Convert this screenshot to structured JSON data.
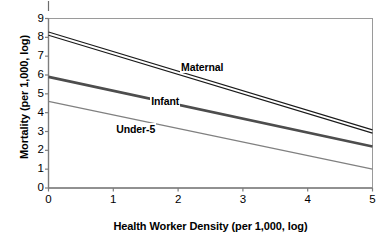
{
  "chart_data": {
    "type": "line",
    "title": "",
    "xlabel": "Health Worker Density (per 1,000, log)",
    "ylabel": "Mortality (per 1,000, log)",
    "xlim": [
      0,
      5
    ],
    "ylim": [
      0,
      9
    ],
    "xticks": [
      "0",
      "1",
      "2",
      "3",
      "4",
      "5"
    ],
    "yticks": [
      "0",
      "1",
      "2",
      "3",
      "4",
      "5",
      "6",
      "7",
      "8",
      "9"
    ],
    "grid": false,
    "legend_position": "inline-labels",
    "x": [
      0,
      5
    ],
    "series": [
      {
        "name": "Maternal",
        "values": [
          8.2,
          3.0
        ],
        "color": "#1a1a1a",
        "style": "double-line",
        "label_x": 2.03,
        "label_y": 6.45
      },
      {
        "name": "Infant",
        "values": [
          5.9,
          2.2
        ],
        "color": "#4d4d4d",
        "style": "thick-line",
        "label_x": 1.57,
        "label_y": 4.62
      },
      {
        "name": "Under-5",
        "values": [
          4.6,
          1.0
        ],
        "color": "#808080",
        "style": "thin-line",
        "label_x": 1.03,
        "label_y": 3.15
      }
    ]
  },
  "axes": {
    "frame_color": "#808080",
    "tick_color": "#808080",
    "text_color": "#000000"
  }
}
